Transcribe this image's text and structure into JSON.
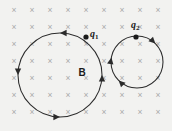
{
  "figure": {
    "kind": "physics-diagram",
    "width": 172,
    "height": 131,
    "background_color": "#f2f2f0",
    "ink_color": "#2b2b2b",
    "field_mark_color": "#a9a9a9"
  },
  "field": {
    "label": "B",
    "label_x": 82,
    "label_y": 73,
    "mark_glyph": "×",
    "mark_name": "field-into-page-cross",
    "columns": 9,
    "rows": 7,
    "origin_x": 14,
    "origin_y": 11,
    "step_x": 18,
    "step_y": 17
  },
  "orbits": [
    {
      "id": "orbit-q1",
      "cx": 60,
      "cy": 75,
      "r": 42,
      "direction": "counterclockwise",
      "arrows": [
        {
          "name": "arrow-top",
          "angle_deg": 270,
          "points": "left"
        },
        {
          "name": "arrow-left",
          "angle_deg": 180,
          "points": "down"
        },
        {
          "name": "arrow-bottom",
          "angle_deg": 90,
          "points": "right"
        },
        {
          "name": "arrow-right",
          "angle_deg": 0,
          "points": "up"
        }
      ]
    },
    {
      "id": "orbit-q2",
      "cx": 137,
      "cy": 62,
      "r": 26,
      "direction": "clockwise",
      "arrows": [
        {
          "name": "arrow-upper-right",
          "angle_deg": 315,
          "points": "down-right"
        },
        {
          "name": "arrow-lower-left",
          "angle_deg": 135,
          "points": "up-left"
        },
        {
          "name": "arrow-left",
          "angle_deg": 190,
          "points": "up"
        }
      ]
    }
  ],
  "charges": [
    {
      "id": "charge-q1",
      "symbol": "q",
      "subscript": "1",
      "dot_x": 86,
      "dot_y": 37,
      "dot_r": 2.6,
      "label_x": 90,
      "label_y": 35
    },
    {
      "id": "charge-q2",
      "symbol": "q",
      "subscript": "2",
      "dot_x": 136,
      "dot_y": 37,
      "dot_r": 2.6,
      "label_x": 131,
      "label_y": 26
    }
  ]
}
